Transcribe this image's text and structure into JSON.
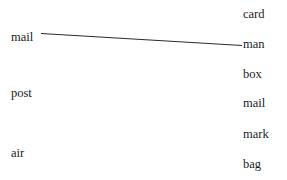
{
  "canvas": {
    "width": 287,
    "height": 180,
    "background_color": "#ffffff"
  },
  "colors": {
    "text": "#1a1a1a",
    "edge": "#2b2b2b",
    "background": "#ffffff"
  },
  "left_column": {
    "name": "stimulus-words",
    "items": [
      {
        "label": "mail",
        "x": 11,
        "center_y": 37
      },
      {
        "label": "post",
        "x": 11,
        "center_y": 93
      },
      {
        "label": "air",
        "x": 11,
        "center_y": 153
      }
    ]
  },
  "right_column": {
    "name": "response-words",
    "items": [
      {
        "label": "card",
        "x": 243,
        "center_y": 14
      },
      {
        "label": "man",
        "x": 243,
        "center_y": 44
      },
      {
        "label": "box",
        "x": 243,
        "center_y": 74
      },
      {
        "label": "mail",
        "x": 243,
        "center_y": 103
      },
      {
        "label": "mark",
        "x": 243,
        "center_y": 134
      },
      {
        "label": "bag",
        "x": 243,
        "center_y": 164
      }
    ]
  },
  "edges": [
    {
      "name": "edge-mail-man",
      "from_label": "mail",
      "to_label": "man",
      "x1": 41,
      "y1": 33.5,
      "x2": 242,
      "y2": 45.5,
      "color": "#2b2b2b",
      "width": 1.15
    }
  ]
}
